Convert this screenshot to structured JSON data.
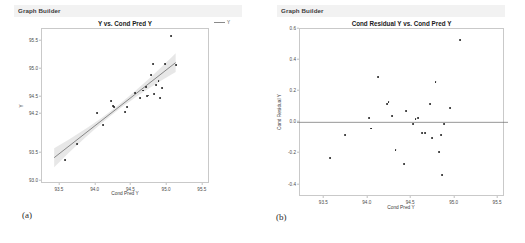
{
  "figure": {
    "caption_a": "(a)",
    "caption_b": "(b)"
  },
  "panel_a": {
    "window_title": "Graph Builder",
    "legend": {
      "label": "Y",
      "icon": "line-swatch"
    }
  },
  "panel_b": {
    "window_title": "Graph Builder"
  },
  "chart_data": [
    {
      "type": "scatter",
      "panel": "a",
      "title": "Y vs. Cond Pred Y",
      "xlabel": "Cond Pred Y",
      "ylabel": "Y",
      "xlim": [
        93.25,
        95.6
      ],
      "ylim": [
        92.95,
        95.72
      ],
      "xticks": [
        "93.5",
        "94.0",
        "94.5",
        "95.0",
        "95.5"
      ],
      "xtick_values": [
        93.5,
        94.0,
        94.5,
        95.0,
        95.5
      ],
      "yticks": [
        "95.5",
        "95.0",
        "94.5",
        "94.2",
        "93.5",
        "93.0"
      ],
      "ytick_values": [
        95.5,
        95.0,
        94.5,
        94.2,
        93.5,
        93.0
      ],
      "grid": false,
      "legend_position": "top-right",
      "legend_entries": [
        "Y"
      ],
      "annotations": [
        "linear fit line with 95% confidence band"
      ],
      "fit_line": {
        "x": [
          93.42,
          95.12
        ],
        "y": [
          93.42,
          95.12
        ]
      },
      "confidence_band_halfwidth": 0.075,
      "x": [
        93.57,
        93.74,
        94.02,
        94.1,
        94.21,
        94.24,
        94.26,
        94.41,
        94.44,
        94.55,
        94.62,
        94.66,
        94.7,
        94.72,
        94.74,
        94.78,
        94.8,
        94.82,
        94.85,
        94.88,
        94.9,
        94.93,
        94.97,
        95.05,
        95.12
      ],
      "y": [
        93.38,
        93.66,
        94.21,
        94.0,
        94.44,
        94.34,
        94.33,
        94.23,
        94.32,
        94.57,
        94.49,
        94.62,
        94.68,
        94.52,
        94.53,
        94.9,
        95.09,
        94.55,
        94.72,
        94.79,
        94.49,
        94.67,
        95.09,
        95.6,
        95.08
      ]
    },
    {
      "type": "scatter",
      "panel": "b",
      "title": "Cond Residual Y vs. Cond Pred Y",
      "xlabel": "Cond Pred Y",
      "ylabel": "Cond Residual Y",
      "xlim": [
        93.22,
        95.58
      ],
      "ylim": [
        -0.48,
        0.6
      ],
      "xticks": [
        "93.5",
        "94.0",
        "94.5",
        "95.0",
        "95.5"
      ],
      "xtick_values": [
        93.5,
        94.0,
        94.5,
        95.0,
        95.5
      ],
      "yticks": [
        "0.6",
        "0.4",
        "0.2",
        "0.0",
        "-0.2",
        "-0.4"
      ],
      "ytick_values": [
        0.6,
        0.4,
        0.2,
        0.0,
        -0.2,
        -0.4
      ],
      "grid": false,
      "legend_position": "none",
      "annotations": [
        "horizontal reference line at y = 0.0"
      ],
      "reference_line_y": 0.0,
      "x": [
        93.57,
        93.74,
        94.02,
        94.04,
        94.12,
        94.22,
        94.24,
        94.28,
        94.32,
        94.42,
        94.44,
        94.52,
        94.55,
        94.58,
        94.62,
        94.66,
        94.72,
        94.74,
        94.78,
        94.82,
        94.84,
        94.86,
        94.88,
        94.95,
        95.06
      ],
      "y": [
        -0.23,
        -0.08,
        0.03,
        -0.04,
        0.29,
        0.12,
        0.13,
        0.04,
        -0.18,
        -0.27,
        0.07,
        -0.01,
        0.02,
        0.03,
        -0.07,
        -0.07,
        0.12,
        -0.1,
        0.26,
        -0.19,
        -0.08,
        -0.34,
        -0.01,
        0.09,
        0.53
      ]
    }
  ]
}
